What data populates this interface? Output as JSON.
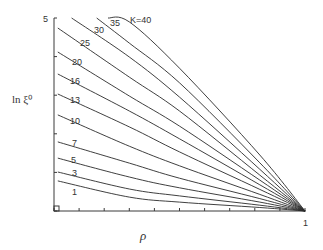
{
  "chart_data": {
    "type": "line",
    "title": "",
    "xlabel": "ρ",
    "ylabel": "ln ξ⁰",
    "xlim": [
      0,
      1
    ],
    "ylim": [
      0,
      5
    ],
    "x_tick_labels": [
      "1"
    ],
    "y_tick_labels": [
      "5"
    ],
    "x_ticks": [
      0,
      0.1,
      0.2,
      0.3,
      0.4,
      0.5,
      0.6,
      0.7,
      0.8,
      0.9,
      1.0
    ],
    "y_ticks": [
      0,
      1,
      2,
      3,
      4,
      5
    ],
    "grid": false,
    "legend": "inline curve labels",
    "series": [
      {
        "name": "K=40",
        "label": "K=40",
        "x": [
          0.215,
          0.3,
          0.5,
          0.82,
          1.0
        ],
        "y": [
          5.0,
          4.9,
          3.7,
          1.45,
          0.0
        ]
      },
      {
        "name": "35",
        "label": "35",
        "x": [
          0.17,
          0.3,
          0.5,
          0.82,
          1.0
        ],
        "y": [
          5.0,
          4.35,
          3.32,
          1.25,
          0.0
        ]
      },
      {
        "name": "30",
        "label": "30",
        "x": [
          0.07,
          0.3,
          0.5,
          0.82,
          1.0
        ],
        "y": [
          5.0,
          3.99,
          2.95,
          1.08,
          0.0
        ]
      },
      {
        "name": "25",
        "label": "25",
        "x": [
          0.015,
          0.3,
          0.5,
          0.82,
          1.0
        ],
        "y": [
          4.74,
          3.47,
          2.59,
          0.93,
          0.0
        ]
      },
      {
        "name": "20",
        "label": "20",
        "x": [
          0.015,
          0.3,
          0.5,
          0.82,
          1.0
        ],
        "y": [
          4.12,
          2.98,
          2.2,
          0.8,
          0.0
        ]
      },
      {
        "name": "16",
        "label": "16",
        "x": [
          0.015,
          0.3,
          0.5,
          0.82,
          1.0
        ],
        "y": [
          3.55,
          2.59,
          1.87,
          0.68,
          0.0
        ]
      },
      {
        "name": "13",
        "label": "13",
        "x": [
          0.015,
          0.3,
          0.5,
          0.82,
          1.0
        ],
        "y": [
          3.03,
          2.18,
          1.53,
          0.56,
          0.0
        ]
      },
      {
        "name": "10",
        "label": "10",
        "x": [
          0.015,
          0.3,
          0.5,
          0.82,
          1.0
        ],
        "y": [
          2.49,
          1.68,
          1.17,
          0.43,
          0.0
        ]
      },
      {
        "name": "7",
        "label": "7",
        "x": [
          0.015,
          0.3,
          0.5,
          0.82,
          1.0
        ],
        "y": [
          1.79,
          1.24,
          0.85,
          0.32,
          0.0
        ]
      },
      {
        "name": "5",
        "label": "5",
        "x": [
          0.015,
          0.3,
          0.5,
          0.82,
          1.0
        ],
        "y": [
          1.37,
          0.88,
          0.6,
          0.23,
          0.0
        ]
      },
      {
        "name": "3",
        "label": "3",
        "x": [
          0.015,
          0.3,
          0.5,
          0.82,
          1.0
        ],
        "y": [
          1.01,
          0.57,
          0.39,
          0.15,
          0.0
        ]
      },
      {
        "name": "1",
        "label": "1",
        "x": [
          0.015,
          0.3,
          0.5,
          0.82,
          1.0
        ],
        "y": [
          0.78,
          0.36,
          0.23,
          0.09,
          0.0
        ]
      }
    ]
  }
}
